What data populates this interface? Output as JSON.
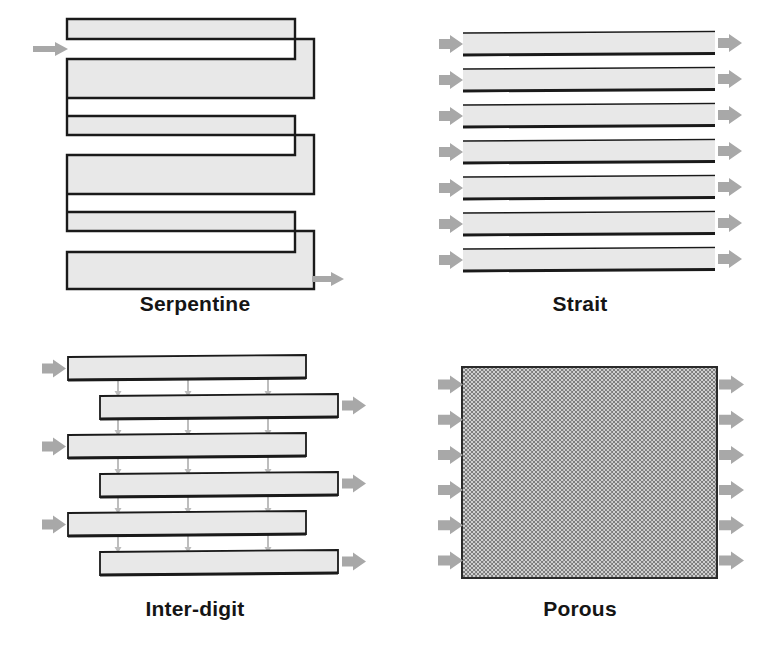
{
  "figure": {
    "background": "#ffffff",
    "width": 765,
    "height": 657
  },
  "style": {
    "channel_fill": "#e8e8e8",
    "channel_stroke": "#1a1a1a",
    "arrow_color": "#a8a8a8",
    "connector_color": "#bdbdbd",
    "label_color": "#151515",
    "porous_dark": "#8a8a8a",
    "porous_light": "#d8d8d8"
  },
  "panels": [
    {
      "id": "serpentine",
      "label": "Serpentine",
      "icon": "serpentine-channel-icon",
      "inlet_arrows": 1,
      "outlet_arrows": 1,
      "passes": 5,
      "turns": 4
    },
    {
      "id": "strait",
      "label": "Strait",
      "icon": "parallel-channel-icon",
      "inlet_arrows": 7,
      "outlet_arrows": 7,
      "channels": 7
    },
    {
      "id": "interdigit",
      "label": "Inter-digit",
      "icon": "interdigitated-channel-icon",
      "inlet_arrows": 3,
      "outlet_arrows": 3,
      "bars": 6,
      "connector_columns": 3
    },
    {
      "id": "porous",
      "label": "Porous",
      "icon": "porous-media-icon",
      "inlet_arrows": 6,
      "outlet_arrows": 6,
      "fill": "dithered-checkerboard"
    }
  ]
}
